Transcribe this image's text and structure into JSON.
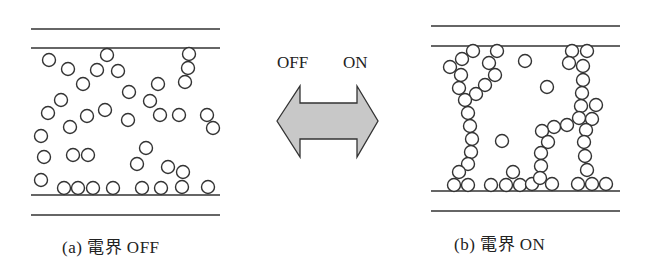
{
  "panels": [
    {
      "id": "a",
      "caption": "(a) 電界 OFF",
      "lines_y": [
        29,
        48,
        195,
        215
      ],
      "x_range": [
        31,
        220
      ],
      "particles": [
        [
          49,
          60
        ],
        [
          68,
          69
        ],
        [
          83,
          84
        ],
        [
          97,
          70
        ],
        [
          107,
          55
        ],
        [
          118,
          71
        ],
        [
          189,
          54
        ],
        [
          188,
          68
        ],
        [
          185,
          82
        ],
        [
          129,
          92
        ],
        [
          158,
          84
        ],
        [
          61,
          100
        ],
        [
          150,
          101
        ],
        [
          48,
          113
        ],
        [
          87,
          116
        ],
        [
          105,
          110
        ],
        [
          128,
          120
        ],
        [
          160,
          115
        ],
        [
          179,
          115
        ],
        [
          207,
          115
        ],
        [
          213,
          128
        ],
        [
          70,
          127
        ],
        [
          41,
          136
        ],
        [
          146,
          148
        ],
        [
          44,
          157
        ],
        [
          73,
          155
        ],
        [
          88,
          155
        ],
        [
          137,
          164
        ],
        [
          168,
          167
        ],
        [
          183,
          172
        ],
        [
          41,
          180
        ],
        [
          64,
          188
        ],
        [
          78,
          188
        ],
        [
          93,
          188
        ],
        [
          113,
          188
        ],
        [
          142,
          188
        ],
        [
          161,
          188
        ],
        [
          182,
          187
        ],
        [
          208,
          187
        ]
      ]
    },
    {
      "id": "b",
      "caption": "(b) 電界 ON",
      "lines_y": [
        26,
        46,
        191,
        211
      ],
      "x_range": [
        431,
        620
      ],
      "particles": [
        [
          473,
          51
        ],
        [
          497,
          51
        ],
        [
          462,
          59
        ],
        [
          489,
          63
        ],
        [
          450,
          67
        ],
        [
          461,
          75
        ],
        [
          495,
          75
        ],
        [
          459,
          88
        ],
        [
          485,
          85
        ],
        [
          476,
          94
        ],
        [
          465,
          100
        ],
        [
          468,
          113
        ],
        [
          470,
          126
        ],
        [
          472,
          139
        ],
        [
          502,
          141
        ],
        [
          471,
          152
        ],
        [
          468,
          164
        ],
        [
          459,
          172
        ],
        [
          513,
          172
        ],
        [
          454,
          185
        ],
        [
          468,
          185
        ],
        [
          491,
          185
        ],
        [
          506,
          185
        ],
        [
          520,
          185
        ],
        [
          532,
          184
        ],
        [
          525,
          61
        ],
        [
          572,
          51
        ],
        [
          587,
          51
        ],
        [
          569,
          63
        ],
        [
          583,
          66
        ],
        [
          547,
          87
        ],
        [
          583,
          80
        ],
        [
          582,
          93
        ],
        [
          581,
          106
        ],
        [
          596,
          105
        ],
        [
          579,
          118
        ],
        [
          592,
          119
        ],
        [
          567,
          125
        ],
        [
          554,
          127
        ],
        [
          542,
          131
        ],
        [
          586,
          130
        ],
        [
          548,
          142
        ],
        [
          584,
          142
        ],
        [
          541,
          153
        ],
        [
          585,
          156
        ],
        [
          541,
          166
        ],
        [
          587,
          170
        ],
        [
          540,
          178
        ],
        [
          552,
          184
        ],
        [
          578,
          184
        ],
        [
          592,
          184
        ],
        [
          606,
          184
        ]
      ]
    }
  ],
  "arrow": {
    "left_label": "OFF",
    "right_label": "ON",
    "fill": "#c8c8c8",
    "stroke": "#333333"
  },
  "particle_radius": 6.5
}
